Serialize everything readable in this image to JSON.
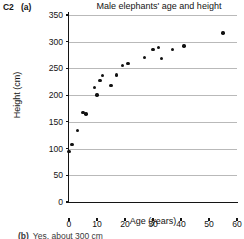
{
  "question": {
    "number": "C2",
    "part": "(a)"
  },
  "answer": {
    "part": "(b)",
    "text": "Yes, about 300 cm"
  },
  "chart_data": {
    "type": "scatter",
    "title": "Male elephants' age and height",
    "xlabel": "Age (years)",
    "ylabel": "Height (cm)",
    "xlim": [
      0,
      60
    ],
    "ylim": [
      0,
      350
    ],
    "xticks": [
      0,
      10,
      20,
      30,
      40,
      50,
      60
    ],
    "yticks": [
      0,
      50,
      100,
      150,
      200,
      250,
      300,
      350
    ],
    "grid": "horizontal",
    "legend": "none",
    "marker_color": "#111111",
    "gridline_color": "#b9b9b9",
    "x": [
      0,
      1,
      3,
      5,
      6,
      9,
      10,
      11,
      12,
      15,
      17,
      19,
      21,
      27,
      30,
      32,
      33,
      37,
      41,
      55
    ],
    "y": [
      95,
      108,
      134,
      168,
      165,
      214,
      200,
      227,
      237,
      218,
      238,
      256,
      259,
      271,
      285,
      289,
      269,
      286,
      292,
      316
    ],
    "points": [
      {
        "x": 0,
        "y": 95
      },
      {
        "x": 1,
        "y": 108
      },
      {
        "x": 3,
        "y": 134
      },
      {
        "x": 5,
        "y": 168
      },
      {
        "x": 6,
        "y": 165
      },
      {
        "x": 9,
        "y": 214
      },
      {
        "x": 10,
        "y": 200
      },
      {
        "x": 11,
        "y": 227
      },
      {
        "x": 12,
        "y": 237
      },
      {
        "x": 15,
        "y": 218
      },
      {
        "x": 17,
        "y": 238
      },
      {
        "x": 19,
        "y": 256
      },
      {
        "x": 21,
        "y": 259
      },
      {
        "x": 27,
        "y": 271
      },
      {
        "x": 30,
        "y": 285
      },
      {
        "x": 32,
        "y": 289
      },
      {
        "x": 33,
        "y": 269
      },
      {
        "x": 37,
        "y": 286
      },
      {
        "x": 41,
        "y": 292
      },
      {
        "x": 55,
        "y": 316
      }
    ]
  }
}
